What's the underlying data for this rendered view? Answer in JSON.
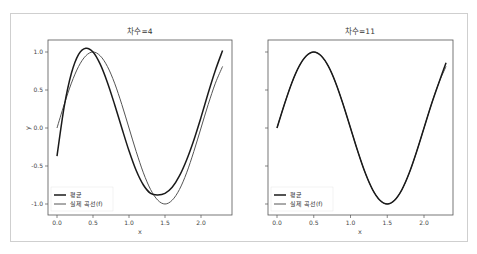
{
  "chart_data": [
    {
      "type": "line",
      "title": "차수=4",
      "xlabel": "x",
      "ylabel": "y",
      "xlim": [
        -0.1,
        2.4
      ],
      "ylim": [
        -1.1,
        1.13
      ],
      "xticks": [
        "0.0",
        "0.5",
        "1.0",
        "1.5",
        "2.0"
      ],
      "yticks": [
        "1.0",
        "0.5",
        "0.0",
        "-0.5",
        "-1.0"
      ],
      "grid": false,
      "legend_position": "lower left",
      "x": [
        0.0,
        0.1,
        0.2,
        0.3,
        0.4,
        0.5,
        0.6,
        0.7,
        0.8,
        0.9,
        1.0,
        1.1,
        1.2,
        1.3,
        1.4,
        1.5,
        1.6,
        1.7,
        1.8,
        1.9,
        2.0,
        2.1,
        2.2,
        2.3
      ],
      "series": [
        {
          "name": "평균",
          "color": "#1a1a1a",
          "width": 1.5,
          "values": [
            -0.37,
            0.28,
            0.72,
            0.97,
            1.05,
            1.0,
            0.84,
            0.6,
            0.31,
            0.0,
            -0.3,
            -0.56,
            -0.75,
            -0.86,
            -0.88,
            -0.86,
            -0.78,
            -0.63,
            -0.42,
            -0.16,
            0.14,
            0.46,
            0.76,
            1.02
          ]
        },
        {
          "name": "실제 곡선(f)",
          "color": "#555555",
          "width": 1.0,
          "values": [
            0.0,
            0.31,
            0.59,
            0.81,
            0.95,
            1.0,
            0.95,
            0.81,
            0.59,
            0.31,
            0.0,
            -0.31,
            -0.59,
            -0.81,
            -0.95,
            -1.0,
            -0.95,
            -0.81,
            -0.59,
            -0.31,
            0.0,
            0.31,
            0.59,
            0.81
          ]
        }
      ]
    },
    {
      "type": "line",
      "title": "차수=11",
      "xlabel": "x",
      "ylabel": "",
      "xlim": [
        -0.1,
        2.4
      ],
      "ylim": [
        -1.1,
        1.13
      ],
      "xticks": [
        "0.0",
        "0.5",
        "1.0",
        "1.5",
        "2.0"
      ],
      "yticks": [
        "",
        "",
        "",
        "",
        ""
      ],
      "grid": false,
      "legend_position": "lower left",
      "x": [
        0.0,
        0.1,
        0.2,
        0.3,
        0.4,
        0.5,
        0.6,
        0.7,
        0.8,
        0.9,
        1.0,
        1.1,
        1.2,
        1.3,
        1.4,
        1.5,
        1.6,
        1.7,
        1.8,
        1.9,
        2.0,
        2.1,
        2.2,
        2.3
      ],
      "series": [
        {
          "name": "평균",
          "color": "#1a1a1a",
          "width": 1.5,
          "values": [
            0.0,
            0.31,
            0.59,
            0.81,
            0.95,
            1.0,
            0.95,
            0.81,
            0.59,
            0.31,
            0.0,
            -0.31,
            -0.59,
            -0.81,
            -0.95,
            -1.0,
            -0.95,
            -0.81,
            -0.59,
            -0.31,
            0.0,
            0.31,
            0.59,
            0.86
          ]
        },
        {
          "name": "실제 곡선(f)",
          "color": "#555555",
          "width": 1.0,
          "values": [
            0.0,
            0.31,
            0.59,
            0.81,
            0.95,
            1.0,
            0.95,
            0.81,
            0.59,
            0.31,
            0.0,
            -0.31,
            -0.59,
            -0.81,
            -0.95,
            -1.0,
            -0.95,
            -0.81,
            -0.59,
            -0.31,
            0.0,
            0.31,
            0.59,
            0.81
          ]
        }
      ]
    }
  ],
  "panels": [
    {
      "title": "차수=4",
      "xlabel": "x",
      "ylabel": "y",
      "legend": [
        "평균",
        "실제 곡선(f)"
      ],
      "xticks": [
        "0.0",
        "0.5",
        "1.0",
        "1.5",
        "2.0"
      ],
      "yticks": [
        "1.0",
        "0.5",
        "0.0",
        "-0.5",
        "-1.0"
      ]
    },
    {
      "title": "차수=11",
      "xlabel": "x",
      "legend": [
        "평균",
        "실제 곡선(f)"
      ],
      "xticks": [
        "0.0",
        "0.5",
        "1.0",
        "1.5",
        "2.0"
      ]
    }
  ]
}
